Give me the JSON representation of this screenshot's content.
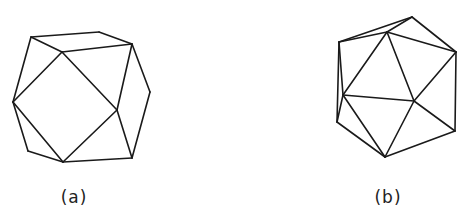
{
  "figures": [
    {
      "id": "a",
      "caption": "(a)",
      "caption_center": [
        74,
        198
      ],
      "description": "polyhedron line drawing (cuboctahedron-like)",
      "vertices": {
        "A": [
          31,
          37
        ],
        "B": [
          99,
          32
        ],
        "C": [
          132,
          44
        ],
        "D": [
          62,
          52
        ],
        "E": [
          13,
          102
        ],
        "F": [
          117,
          110
        ],
        "G": [
          150,
          92
        ],
        "H": [
          132,
          158
        ],
        "I": [
          63,
          162
        ],
        "J": [
          28,
          151
        ]
      },
      "edges": [
        [
          "A",
          "B"
        ],
        [
          "B",
          "C"
        ],
        [
          "A",
          "D"
        ],
        [
          "D",
          "C"
        ],
        [
          "A",
          "E"
        ],
        [
          "D",
          "E"
        ],
        [
          "D",
          "F"
        ],
        [
          "C",
          "G"
        ],
        [
          "C",
          "F"
        ],
        [
          "G",
          "H"
        ],
        [
          "F",
          "H"
        ],
        [
          "E",
          "I"
        ],
        [
          "E",
          "J"
        ],
        [
          "J",
          "I"
        ],
        [
          "F",
          "I"
        ],
        [
          "I",
          "H"
        ]
      ]
    },
    {
      "id": "b",
      "caption": "(b)",
      "caption_center": [
        388,
        198
      ],
      "description": "polyhedron line drawing (icosahedron-like)",
      "vertices": {
        "P": [
          412,
          17
        ],
        "Q": [
          387,
          32
        ],
        "R": [
          339,
          42
        ],
        "S": [
          456,
          52
        ],
        "T": [
          343,
          95
        ],
        "U": [
          414,
          101
        ],
        "V": [
          337,
          122
        ],
        "W": [
          455,
          131
        ],
        "X": [
          385,
          157
        ]
      },
      "edges": [
        [
          "R",
          "P"
        ],
        [
          "R",
          "Q"
        ],
        [
          "Q",
          "P"
        ],
        [
          "P",
          "S"
        ],
        [
          "Q",
          "S"
        ],
        [
          "R",
          "V"
        ],
        [
          "R",
          "T"
        ],
        [
          "T",
          "V"
        ],
        [
          "Q",
          "T"
        ],
        [
          "Q",
          "U"
        ],
        [
          "S",
          "U"
        ],
        [
          "S",
          "W"
        ],
        [
          "T",
          "U"
        ],
        [
          "U",
          "W"
        ],
        [
          "U",
          "X"
        ],
        [
          "T",
          "X"
        ],
        [
          "V",
          "X"
        ],
        [
          "W",
          "X"
        ]
      ]
    }
  ],
  "style": {
    "stroke_color": "#1a1a1a",
    "background": "#ffffff"
  }
}
